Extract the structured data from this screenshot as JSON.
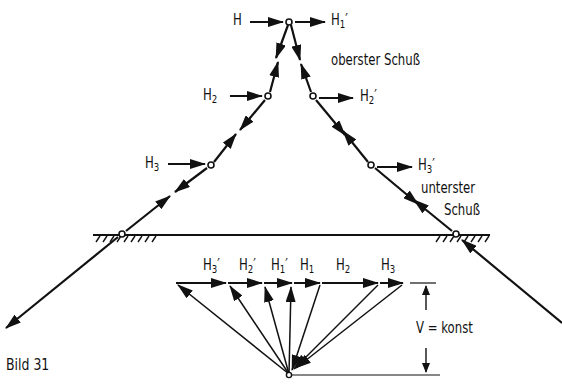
{
  "figure": {
    "caption": "Bild 31",
    "colors": {
      "ink": "#111111",
      "background": "#ffffff"
    }
  },
  "structure": {
    "labels": {
      "H": {
        "base": "H",
        "sub": "",
        "prime": ""
      },
      "H1p": {
        "base": "H",
        "sub": "1",
        "prime": "′"
      },
      "H2": {
        "base": "H",
        "sub": "2",
        "prime": ""
      },
      "H2p": {
        "base": "H",
        "sub": "2",
        "prime": "′"
      },
      "H3": {
        "base": "H",
        "sub": "3",
        "prime": ""
      },
      "H3p": {
        "base": "H",
        "sub": "3",
        "prime": "′"
      }
    },
    "annotations": {
      "top_segment": "oberster Schuß",
      "bottom_segment_line1": "unterster",
      "bottom_segment_line2": "Schuß"
    },
    "nodes": [
      {
        "id": "top",
        "x": 289,
        "y": 22
      },
      {
        "id": "left-2",
        "x": 268,
        "y": 96
      },
      {
        "id": "left-3",
        "x": 211,
        "y": 165
      },
      {
        "id": "left-ground",
        "x": 122,
        "y": 234
      },
      {
        "id": "right-2",
        "x": 313,
        "y": 96
      },
      {
        "id": "right-3",
        "x": 371,
        "y": 165
      },
      {
        "id": "right-ground",
        "x": 456,
        "y": 234
      }
    ],
    "ground_line": {
      "x1": 93,
      "x2": 490,
      "y": 235
    }
  },
  "force_polygon": {
    "labels": [
      "H3′",
      "H2′",
      "H1′",
      "H1",
      "H2",
      "H3"
    ],
    "label_parts": [
      {
        "base": "H",
        "sub": "3",
        "prime": "′"
      },
      {
        "base": "H",
        "sub": "2",
        "prime": "′"
      },
      {
        "base": "H",
        "sub": "1",
        "prime": "′"
      },
      {
        "base": "H",
        "sub": "1",
        "prime": ""
      },
      {
        "base": "H",
        "sub": "2",
        "prime": ""
      },
      {
        "base": "H",
        "sub": "3",
        "prime": ""
      }
    ],
    "top_points_x": [
      176,
      228,
      264,
      294,
      322,
      380,
      404
    ],
    "top_y": 283,
    "pole": {
      "x": 289,
      "y": 375
    },
    "dimension": {
      "label": "V = konst",
      "x": 426,
      "y_top": 283,
      "y_bottom": 375
    }
  }
}
